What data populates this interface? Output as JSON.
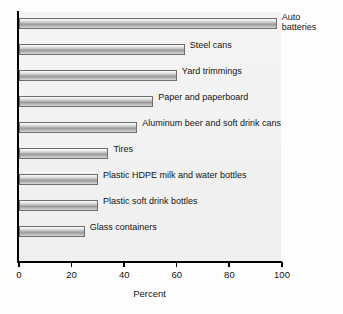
{
  "chart_data": {
    "type": "bar",
    "orientation": "horizontal",
    "title": "",
    "xlabel": "Percent",
    "ylabel": "",
    "xlim": [
      0,
      100
    ],
    "grid": false,
    "legend": null,
    "xticks": [
      "0",
      "20",
      "40",
      "60",
      "80",
      "100"
    ],
    "xtick_values": [
      0,
      20,
      40,
      60,
      80,
      100
    ],
    "categories": [
      "Auto batteries",
      "Steel cans",
      "Yard trimmings",
      "Paper and paperboard",
      "Aluminum beer and soft drink cans",
      "Tires",
      "Plastic HDPE milk and water bottles",
      "Plastic soft drink bottles",
      "Glass containers"
    ],
    "values": [
      98,
      63,
      60,
      51,
      45,
      34,
      30,
      30,
      25
    ],
    "bars": [
      {
        "label": "Auto batteries",
        "value": 98,
        "label_lines": [
          "Auto",
          "batteries"
        ]
      },
      {
        "label": "Steel cans",
        "value": 63,
        "label_lines": [
          "Steel cans"
        ]
      },
      {
        "label": "Yard trimmings",
        "value": 60,
        "label_lines": [
          "Yard trimmings"
        ]
      },
      {
        "label": "Paper and paperboard",
        "value": 51,
        "label_lines": [
          "Paper and paperboard"
        ]
      },
      {
        "label": "Aluminum beer and soft drink cans",
        "value": 45,
        "label_lines": [
          "Aluminum beer and soft drink cans"
        ]
      },
      {
        "label": "Tires",
        "value": 34,
        "label_lines": [
          "Tires"
        ]
      },
      {
        "label": "Plastic HDPE milk and water bottles",
        "value": 30,
        "label_lines": [
          "Plastic HDPE milk and water bottles"
        ]
      },
      {
        "label": "Plastic soft drink bottles",
        "value": 30,
        "label_lines": [
          "Plastic soft drink bottles"
        ]
      },
      {
        "label": "Glass containers",
        "value": 25,
        "label_lines": [
          "Glass containers"
        ]
      }
    ],
    "colors": {
      "bar_fill_light": "#fbfbfb",
      "bar_fill_mid": "#9a9a9a",
      "bar_border": "#6e6e6e",
      "plot_background": "#f2f2f2",
      "axis": "#000000",
      "text": "#141414"
    }
  }
}
